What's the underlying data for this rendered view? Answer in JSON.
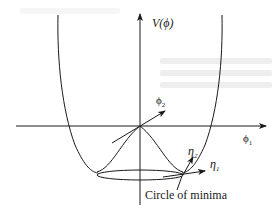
{
  "diagram": {
    "labels": {
      "v_axis": "V(ϕ)",
      "phi1": "ϕ",
      "phi1_sub": "1",
      "phi2": "ϕ",
      "phi2_sub": "2",
      "eta1": "η",
      "eta1_sub": "1",
      "eta2": "η",
      "eta2_sub": "2",
      "circle_of_minima": "Circle of minima"
    },
    "colors": {
      "stroke": "#1a1a1a",
      "background": "#ffffff",
      "bleed_through": "#eeeeee"
    },
    "elements": [
      {
        "id": "vertical-axis",
        "type": "arrow",
        "label": "V(ϕ)"
      },
      {
        "id": "horizontal-axis",
        "type": "arrow",
        "label": "ϕ1"
      },
      {
        "id": "potential-bowl",
        "type": "curve"
      },
      {
        "id": "central-hump",
        "type": "curve"
      },
      {
        "id": "circle-of-minima",
        "type": "ellipse",
        "label": "Circle of minima"
      },
      {
        "id": "phi2-vector",
        "type": "arrow",
        "label": "ϕ2"
      },
      {
        "id": "eta1-vector",
        "type": "arrow",
        "label": "η1"
      },
      {
        "id": "eta2-vector",
        "type": "arrow",
        "label": "η2"
      }
    ]
  }
}
